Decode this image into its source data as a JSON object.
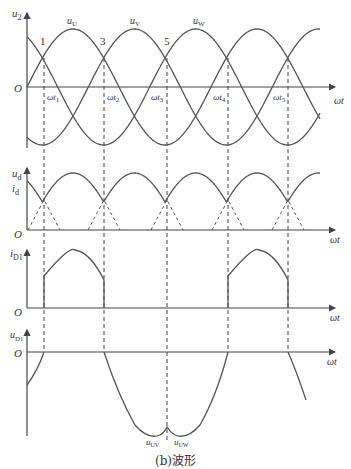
{
  "caption": "(b)波形",
  "colors": {
    "line": "#555555",
    "axis": "#444444",
    "text": "#333333",
    "background": "#ffffff"
  },
  "graphs": [
    {
      "id": "u2",
      "y_label": "u2",
      "y_label_main": "u",
      "y_label_sub": "2",
      "origin_label": "O",
      "x_label": "ωt",
      "curves": [
        "uU",
        "uV",
        "uW"
      ],
      "curve_labels": [
        {
          "main": "u",
          "sub": "U"
        },
        {
          "main": "u",
          "sub": "V"
        },
        {
          "main": "u",
          "sub": "W"
        }
      ],
      "point_labels": [
        "1",
        "3",
        "5"
      ],
      "tick_labels": [
        {
          "main": "ωt",
          "sub": "1"
        },
        {
          "main": "ωt",
          "sub": "2"
        },
        {
          "main": "ωt",
          "sub": "3"
        },
        {
          "main": "ωt",
          "sub": "4"
        },
        {
          "main": "ωt",
          "sub": "5"
        }
      ]
    },
    {
      "id": "ud_id",
      "y_label_1_main": "u",
      "y_label_1_sub": "d",
      "y_label_2_main": "i",
      "y_label_2_sub": "d",
      "origin_label": "O",
      "x_label": "ωt"
    },
    {
      "id": "iD1",
      "y_label_main": "i",
      "y_label_sub": "D1",
      "origin_label": "O",
      "x_label": "ωt"
    },
    {
      "id": "uD1",
      "y_label_main": "u",
      "y_label_sub": "D1",
      "origin_label": "O",
      "x_label": "ωt",
      "curve_labels": [
        {
          "main": "u",
          "sub": "UV"
        },
        {
          "main": "u",
          "sub": "UW"
        }
      ]
    }
  ]
}
